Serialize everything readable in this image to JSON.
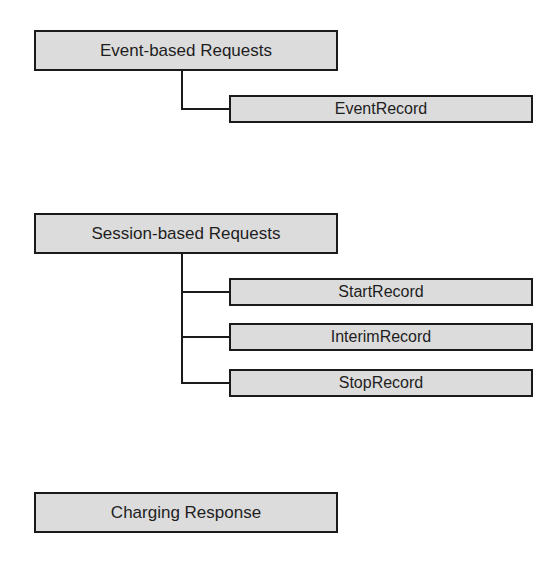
{
  "diagram": {
    "groups": [
      {
        "id": "event-based",
        "label": "Event-based Requests",
        "children": [
          {
            "label": "EventRecord"
          }
        ]
      },
      {
        "id": "session-based",
        "label": "Session-based Requests",
        "children": [
          {
            "label": "StartRecord"
          },
          {
            "label": "InterimRecord"
          },
          {
            "label": "StopRecord"
          }
        ]
      },
      {
        "id": "charging-response",
        "label": "Charging Response",
        "children": []
      }
    ],
    "colors": {
      "box_fill": "#dcdcdc",
      "border": "#1a1a1a",
      "text": "#1e1e1e",
      "background": "#ffffff"
    }
  }
}
